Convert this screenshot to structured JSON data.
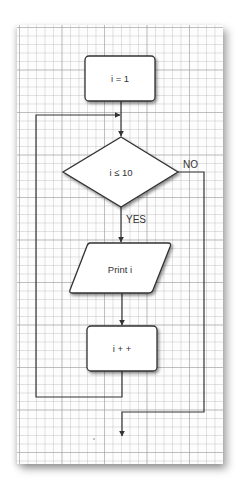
{
  "diagram": {
    "type": "flowchart",
    "background": "grid-paper",
    "nodes": [
      {
        "id": "init",
        "shape": "rounded-rectangle",
        "label": "i = 1"
      },
      {
        "id": "condition",
        "shape": "diamond",
        "label": "i ≤ 10"
      },
      {
        "id": "print",
        "shape": "parallelogram",
        "label": "Print i"
      },
      {
        "id": "increment",
        "shape": "rounded-rectangle",
        "label": "i + +"
      }
    ],
    "edges": [
      {
        "from": "init",
        "to": "condition",
        "label": ""
      },
      {
        "from": "condition",
        "to": "print",
        "label": "YES"
      },
      {
        "from": "condition",
        "to": "exit",
        "label": "NO"
      },
      {
        "from": "print",
        "to": "increment",
        "label": ""
      },
      {
        "from": "increment",
        "to": "condition",
        "label": ""
      }
    ],
    "colors": {
      "stroke": "#333333",
      "fill": "#ffffff",
      "grid": "#d0d0d0"
    }
  }
}
